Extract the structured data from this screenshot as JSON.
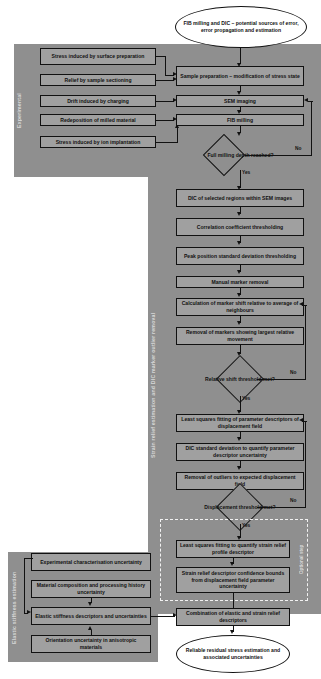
{
  "diagram": {
    "colors": {
      "band": "#8f8f8f",
      "node_fill": "#a0a0a0",
      "terminal_fill": "#ffffff",
      "stroke": "#111111",
      "section_label": "#d8d8d8",
      "dashed_outline": "#f2f2f2",
      "background": "#ffffff"
    }
  },
  "sections": {
    "experimental": {
      "label": "Experimental"
    },
    "strain": {
      "label": "Strain relief estimation and DIC marker outlier removal"
    },
    "elastic": {
      "label": "Elastic stiffness estimation"
    },
    "optional": {
      "label": "Optional step"
    }
  },
  "nodes": {
    "start": "FIB milling and DIC – potential sources of error, error propagation and estimation",
    "err_surface_prep": "Stress induced by surface preparation",
    "err_sectioning": "Relief by sample sectioning",
    "err_charging": "Drift induced by charging",
    "err_redeposition": "Redeposition of milled material",
    "err_implantation": "Stress induced by ion implantation",
    "sample_prep": "Sample preparation – modification of stress state",
    "sem_imaging": "SEM imaging",
    "fib_milling": "FIB milling",
    "dec_full_depth": "Full milling depth reached?",
    "dic_regions": "DIC of selected regions within SEM images",
    "corr_threshold": "Correlation coefficient thresholding",
    "peak_threshold": "Peak position standard deviation thresholding",
    "manual_removal": "Manual marker removal",
    "marker_shift": "Calculation of marker shift relative to average of neighbours",
    "marker_removal": "Removal of markers showing largest relative movement",
    "dec_rel_shift": "Relative shift threshold met?",
    "lsq_param": "Least squares fitting of parameter descriptors of displacement field",
    "dic_stddev": "DIC standard deviation to quantify parameter descriptor uncertainty",
    "outlier_removal": "Removal of outliers to expected displacement field",
    "dec_displacement": "Displacement threshold met?",
    "lsq_strain": "Least squares fitting to quantify strain relief profile descriptor",
    "strain_conf": "Strain relief descriptor confidence bounds from displacement field parameter uncertainty",
    "exp_char": "Experimental characterisation uncertainty",
    "mat_comp": "Material composition and processing history uncertainty",
    "elastic_desc": "Elastic stiffness descriptors and uncertainties",
    "orientation": "Orientation uncertainty in anisotropic materials",
    "combination": "Combination of elastic and strain relief descriptors",
    "end": "Reliable residual stress estimation and associated uncertainties"
  },
  "edge_labels": {
    "no_depth": "No",
    "yes_depth": "Yes",
    "no_shift": "No",
    "yes_shift": "Yes",
    "no_disp": "No",
    "yes_disp": "Yes"
  }
}
